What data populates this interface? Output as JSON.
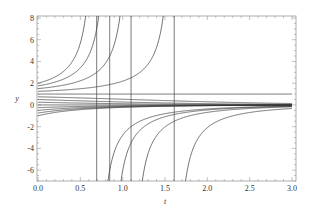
{
  "chart_data": {
    "type": "line",
    "title": "",
    "xlabel": "t",
    "ylabel": "y",
    "xlim": [
      0,
      3
    ],
    "ylim": [
      -7,
      8
    ],
    "grid": false,
    "legend": null,
    "x_ticks": [
      "0.0",
      "0.5",
      "1.0",
      "1.5",
      "2.0",
      "2.5",
      "3.0"
    ],
    "x_tick_values": [
      0,
      0.5,
      1.0,
      1.5,
      2.0,
      2.5,
      3.0
    ],
    "y_ticks": [
      "-6",
      "-4",
      "-2",
      "0",
      "2",
      "4",
      "6",
      "8"
    ],
    "y_tick_values": [
      -6,
      -4,
      -2,
      0,
      2,
      4,
      6,
      8
    ],
    "initial_values": [
      -1,
      -0.75,
      -0.5,
      -0.25,
      0,
      0.25,
      0.5,
      0.75,
      1,
      1.25,
      1.5,
      1.75,
      2
    ],
    "vertical_asymptotes": [
      0.693,
      0.847,
      1.099,
      1.609
    ],
    "series": [
      {
        "name": "y0=2",
        "x": [
          0,
          0.25,
          0.5,
          0.6,
          0.65,
          0.68
        ],
        "values": [
          2,
          2.79,
          5.08,
          10.5,
          22.3,
          77
        ]
      },
      {
        "name": "y0=1.75",
        "x": [
          0,
          0.25,
          0.5,
          0.7,
          0.8
        ],
        "values": [
          1.75,
          2.21,
          3.35,
          6.33,
          18.5
        ]
      },
      {
        "name": "y0=1.5",
        "x": [
          0,
          0.25,
          0.5,
          0.75,
          1.0
        ],
        "values": [
          1.5,
          1.75,
          2.21,
          3.36,
          11.4
        ]
      },
      {
        "name": "y0=1.25",
        "x": [
          0,
          0.5,
          1.0,
          1.4,
          1.55
        ],
        "values": [
          1.25,
          1.47,
          2.2,
          5.0,
          16.6
        ]
      },
      {
        "name": "y0=1",
        "x": [
          0,
          3
        ],
        "values": [
          1,
          1
        ]
      },
      {
        "name": "y0=0.75",
        "x": [
          0,
          1,
          2,
          3
        ],
        "values": [
          0.75,
          0.52,
          0.29,
          0.13
        ]
      },
      {
        "name": "y0=0.5",
        "x": [
          0,
          1,
          2,
          3
        ],
        "values": [
          0.5,
          0.27,
          0.12,
          0.05
        ]
      },
      {
        "name": "y0=0",
        "x": [
          0,
          3
        ],
        "values": [
          0,
          0
        ]
      },
      {
        "name": "y0=-0.5",
        "x": [
          0,
          1,
          2,
          3
        ],
        "values": [
          -0.5,
          -0.22,
          -0.08,
          -0.03
        ]
      },
      {
        "name": "y0=-1",
        "x": [
          0,
          1,
          2,
          3
        ],
        "values": [
          -1,
          -0.45,
          -0.16,
          -0.05
        ]
      }
    ]
  },
  "plot": {
    "x_pixel_range": [
      38,
      292
    ],
    "y_pixel_range": [
      181,
      18
    ],
    "frame": {
      "left": 37,
      "top": 16,
      "right": 296,
      "bottom": 181
    },
    "colors": {
      "curve": "#333333",
      "frame": "#999999",
      "text": "#333333"
    }
  }
}
